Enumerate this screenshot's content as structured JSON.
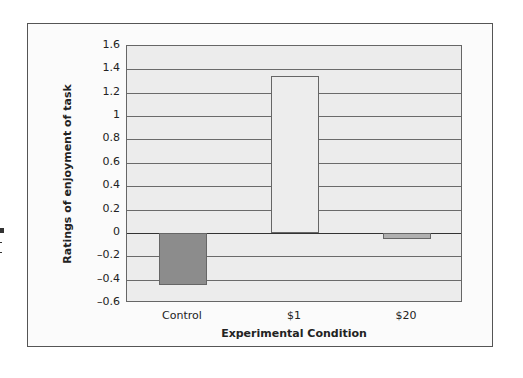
{
  "chart_data": {
    "type": "bar",
    "title": "",
    "xlabel": "Experimental Condition",
    "ylabel": "Ratings of enjoyment of task",
    "categories": [
      "Control",
      "$1",
      "$20"
    ],
    "values": [
      -0.45,
      1.34,
      -0.05
    ],
    "bar_colors": [
      "#8c8c8c",
      "#ededed",
      "#b0b0b0"
    ],
    "ylim": [
      -0.6,
      1.6
    ],
    "yticks": [
      1.6,
      1.4,
      1.2,
      1,
      0.8,
      0.6,
      0.4,
      0.2,
      0,
      -0.2,
      -0.4,
      -0.6
    ],
    "ytick_labels": [
      "1.6",
      "1.4",
      "1.2",
      "1",
      "0.8",
      "0.6",
      "0.4",
      "0.2",
      "0",
      "–0.2",
      "–0.4",
      "–0.6"
    ],
    "grid": true,
    "legend": null
  }
}
